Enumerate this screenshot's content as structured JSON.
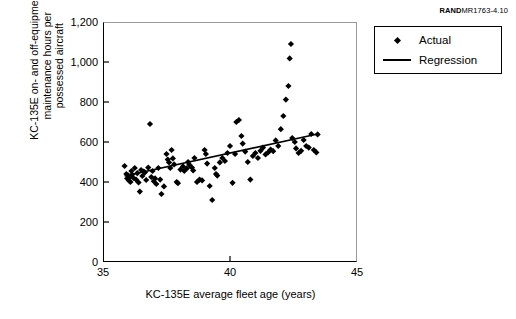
{
  "source_id": {
    "brand": "RAND",
    "code": "MR1763-4.10"
  },
  "legend": {
    "position": "top-right-outside",
    "items": [
      {
        "label": "Actual",
        "key": "diamond-marker"
      },
      {
        "label": "Regression",
        "key": "line-segment"
      }
    ]
  },
  "chart_data": {
    "type": "scatter",
    "title": "",
    "subtitle": "",
    "xlabel": "KC-135E average fleet age (years)",
    "ylabel": "KC-135E on- and off-equipment\nmaintenance hours per\npossessed aircraft",
    "xlim": [
      35,
      45
    ],
    "ylim": [
      0,
      1200
    ],
    "xticks": [
      35,
      40,
      45
    ],
    "xticklabels": [
      "35",
      "40",
      "45"
    ],
    "yticks": [
      0,
      200,
      400,
      600,
      800,
      1000,
      1200
    ],
    "yticklabels": [
      "0",
      "200",
      "400",
      "600",
      "800",
      "1,000",
      "1,200"
    ],
    "grid": false,
    "marker_color": "#000000",
    "line_color": "#000000",
    "series": [
      {
        "name": "Actual",
        "type": "scatter",
        "marker": "diamond",
        "points": [
          [
            35.85,
            480
          ],
          [
            35.92,
            440
          ],
          [
            35.95,
            418
          ],
          [
            36.0,
            432
          ],
          [
            36.02,
            408
          ],
          [
            36.05,
            425
          ],
          [
            36.08,
            400
          ],
          [
            36.12,
            455
          ],
          [
            36.15,
            437
          ],
          [
            36.2,
            420
          ],
          [
            36.25,
            470
          ],
          [
            36.3,
            412
          ],
          [
            36.35,
            444
          ],
          [
            36.4,
            398
          ],
          [
            36.45,
            352
          ],
          [
            36.5,
            460
          ],
          [
            36.55,
            430
          ],
          [
            36.6,
            452
          ],
          [
            36.65,
            448
          ],
          [
            36.7,
            410
          ],
          [
            36.78,
            472
          ],
          [
            36.85,
            690
          ],
          [
            36.9,
            425
          ],
          [
            36.95,
            455
          ],
          [
            37.0,
            404
          ],
          [
            37.05,
            418
          ],
          [
            37.1,
            390
          ],
          [
            37.18,
            470
          ],
          [
            37.25,
            412
          ],
          [
            37.3,
            340
          ],
          [
            37.4,
            378
          ],
          [
            37.5,
            540
          ],
          [
            37.55,
            512
          ],
          [
            37.6,
            498
          ],
          [
            37.65,
            470
          ],
          [
            37.7,
            560
          ],
          [
            37.75,
            518
          ],
          [
            37.8,
            488
          ],
          [
            37.9,
            400
          ],
          [
            37.95,
            394
          ],
          [
            38.05,
            462
          ],
          [
            38.15,
            478
          ],
          [
            38.2,
            455
          ],
          [
            38.3,
            468
          ],
          [
            38.35,
            500
          ],
          [
            38.4,
            486
          ],
          [
            38.5,
            472
          ],
          [
            38.55,
            458
          ],
          [
            38.6,
            520
          ],
          [
            38.7,
            400
          ],
          [
            38.8,
            412
          ],
          [
            38.9,
            408
          ],
          [
            39.0,
            560
          ],
          [
            39.05,
            540
          ],
          [
            39.1,
            492
          ],
          [
            39.2,
            380
          ],
          [
            39.3,
            310
          ],
          [
            39.4,
            470
          ],
          [
            39.45,
            440
          ],
          [
            39.5,
            432
          ],
          [
            39.6,
            498
          ],
          [
            39.7,
            520
          ],
          [
            39.8,
            505
          ],
          [
            39.9,
            545
          ],
          [
            40.0,
            580
          ],
          [
            40.1,
            396
          ],
          [
            40.2,
            540
          ],
          [
            40.25,
            700
          ],
          [
            40.35,
            710
          ],
          [
            40.45,
            630
          ],
          [
            40.5,
            592
          ],
          [
            40.6,
            552
          ],
          [
            40.7,
            500
          ],
          [
            40.8,
            412
          ],
          [
            40.9,
            530
          ],
          [
            41.0,
            545
          ],
          [
            41.1,
            520
          ],
          [
            41.2,
            556
          ],
          [
            41.3,
            572
          ],
          [
            41.4,
            538
          ],
          [
            41.5,
            548
          ],
          [
            41.6,
            562
          ],
          [
            41.7,
            554
          ],
          [
            41.8,
            608
          ],
          [
            41.9,
            580
          ],
          [
            42.0,
            664
          ],
          [
            42.1,
            730
          ],
          [
            42.2,
            812
          ],
          [
            42.3,
            880
          ],
          [
            42.35,
            1018
          ],
          [
            42.4,
            1090
          ],
          [
            42.45,
            620
          ],
          [
            42.55,
            600
          ],
          [
            42.6,
            568
          ],
          [
            42.7,
            545
          ],
          [
            42.8,
            556
          ],
          [
            42.9,
            610
          ],
          [
            43.0,
            580
          ],
          [
            43.1,
            572
          ],
          [
            43.2,
            640
          ],
          [
            43.3,
            560
          ],
          [
            43.4,
            548
          ],
          [
            43.45,
            638
          ]
        ]
      },
      {
        "name": "Regression",
        "type": "line",
        "endpoints": [
          [
            35.85,
            430
          ],
          [
            43.45,
            640
          ]
        ]
      }
    ]
  }
}
